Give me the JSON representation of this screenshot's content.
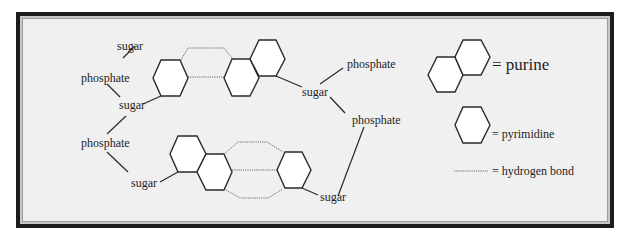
{
  "figure": {
    "type": "base-pairing diagram",
    "background_color": "#f0f0f0",
    "frame_color": "#1c1c1c"
  },
  "top_pair": {
    "labels": {
      "sugar_top_left": "sugar",
      "phosphate_left": "phosphate",
      "sugar_mid_left": "sugar",
      "sugar_right": "sugar",
      "phosphate_right_top": "phosphate",
      "phosphate_right_mid": "phosphate"
    },
    "left_base": "pyrimidine",
    "right_base": "purine",
    "hydrogen_bonds": 2
  },
  "bottom_pair": {
    "labels": {
      "phosphate_left": "phosphate",
      "sugar_left": "sugar",
      "sugar_right": "sugar"
    },
    "left_base": "purine",
    "right_base": "pyrimidine",
    "hydrogen_bonds": 3
  },
  "legend": {
    "items": [
      {
        "symbol": "purine",
        "label": "= purine"
      },
      {
        "symbol": "pyrimidine",
        "label": "= pyrimidine"
      },
      {
        "symbol": "hydrogen-bond",
        "label": "= hydrogen bond"
      }
    ]
  }
}
